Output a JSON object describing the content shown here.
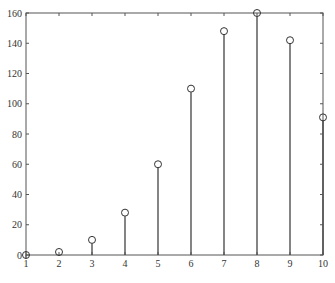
{
  "chart_data": {
    "type": "stem",
    "title": "",
    "xlabel": "",
    "ylabel": "",
    "x": [
      1,
      2,
      3,
      4,
      5,
      6,
      7,
      8,
      9,
      10
    ],
    "values": [
      0,
      2,
      10,
      28,
      60,
      110,
      148,
      160,
      142,
      91
    ],
    "xlim": [
      1,
      10
    ],
    "ylim": [
      0,
      160
    ],
    "xticks": [
      "1",
      "2",
      "3",
      "4",
      "5",
      "6",
      "7",
      "8",
      "9",
      "10"
    ],
    "yticks": [
      "0",
      "20",
      "40",
      "60",
      "80",
      "100",
      "120",
      "140",
      "160"
    ],
    "marker": "open-circle",
    "grid": false,
    "legend": null
  },
  "style": {
    "axis_color": "#555555",
    "stem_color": "#333333",
    "background": "#ffffff"
  }
}
